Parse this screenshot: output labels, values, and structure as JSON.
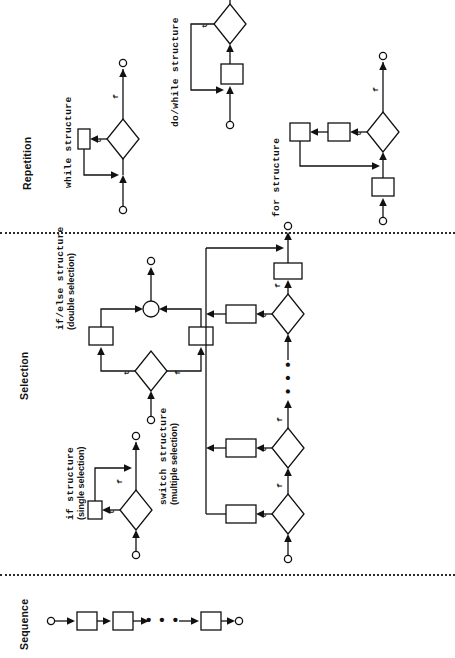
{
  "figure": {
    "orientation": "rotated-90-ccw",
    "ink_color": "#111111",
    "background": "#ffffff"
  },
  "sections": [
    {
      "id": "repetition",
      "label": "Repetition"
    },
    {
      "id": "selection",
      "label": "Selection"
    },
    {
      "id": "sequence",
      "label": "Sequence"
    }
  ],
  "structures": {
    "while": {
      "name": "while structure",
      "subtitle": ""
    },
    "do_while": {
      "name": "do/while structure",
      "subtitle": ""
    },
    "for": {
      "name": "for structure",
      "subtitle": ""
    },
    "if_else": {
      "name": "if/else structure",
      "subtitle": "(double selection)"
    },
    "if": {
      "name": "if structure",
      "subtitle": "(single selection)"
    },
    "switch": {
      "name": "switch structure",
      "subtitle": "(multiple selection)"
    }
  },
  "edge_labels": {
    "true": "t",
    "false": "f"
  },
  "ellipsis": "• • •",
  "glyphs": {
    "connector": "small-open-circle",
    "decision": "diamond",
    "action": "rectangle",
    "merge": "open-circle"
  },
  "counts": {
    "while": {
      "decisions": 1,
      "actions": 1,
      "connectors": 2
    },
    "do_while": {
      "decisions": 1,
      "actions": 1,
      "connectors": 2
    },
    "for": {
      "decisions": 1,
      "actions": 3,
      "connectors": 2
    },
    "if_else": {
      "decisions": 1,
      "actions": 2,
      "merges": 1,
      "connectors": 2
    },
    "if": {
      "decisions": 1,
      "actions": 1,
      "connectors": 2
    },
    "switch": {
      "decisions": 3,
      "actions": 4,
      "connectors": 2
    },
    "sequence": {
      "actions": 3,
      "connectors": 2
    }
  }
}
